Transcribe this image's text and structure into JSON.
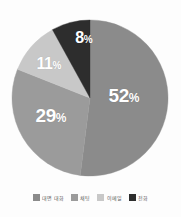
{
  "chart_data": {
    "type": "pie",
    "title": "",
    "categories": [
      "대면 대화",
      "채팅",
      "이메일",
      "전화"
    ],
    "values": [
      52,
      29,
      11,
      8
    ],
    "labels": [
      "52%",
      "29%",
      "11%",
      "8%"
    ],
    "unit": "%",
    "colors": [
      "#8a8a8a",
      "#9a9a9a",
      "#c8c8c8",
      "#2a2a2a"
    ],
    "start_angle_deg": 0,
    "direction": "clockwise",
    "legend_position": "bottom",
    "grid": false,
    "xlabel": "",
    "ylabel": "",
    "background_color": "#fdfdfd",
    "label_color": "#ffffff"
  },
  "slices": [
    {
      "name": "대면 대화",
      "value": 52,
      "label_number": "52",
      "label_percent": "%",
      "color": "#8a8a8a",
      "label_x": 124,
      "label_y": 95
    },
    {
      "name": "채팅",
      "value": 29,
      "label_number": "29",
      "label_percent": "%",
      "color": "#9a9a9a",
      "label_x": 51,
      "label_y": 115
    },
    {
      "name": "이메일",
      "value": 11,
      "label_number": "11",
      "label_percent": "%",
      "color": "#c8c8c8",
      "label_x": 49,
      "label_y": 64
    },
    {
      "name": "전화",
      "value": 8,
      "label_number": "8",
      "label_percent": "%",
      "color": "#2a2a2a",
      "label_x": 84,
      "label_y": 38
    }
  ],
  "legend": {
    "items": [
      {
        "label": "대면 대화",
        "color": "#8a8a8a"
      },
      {
        "label": "채팅",
        "color": "#9a9a9a"
      },
      {
        "label": "이메일",
        "color": "#c8c8c8"
      },
      {
        "label": "전화",
        "color": "#2a2a2a"
      }
    ]
  },
  "geometry": {
    "center_x": 90,
    "center_y": 98,
    "radius": 78
  }
}
